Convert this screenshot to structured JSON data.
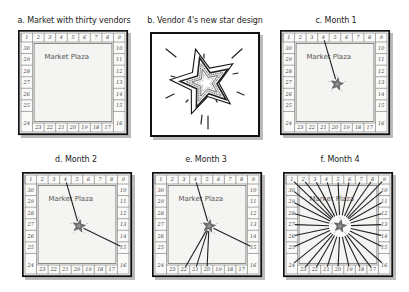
{
  "figure": {
    "panels": [
      {
        "id": "a",
        "title": "a. Market with thirty vendors",
        "type": "market",
        "connections": [],
        "show_star": false
      },
      {
        "id": "b",
        "title": "b. Vendor 4's new star design",
        "type": "star"
      },
      {
        "id": "c",
        "title": "c.  Month 1",
        "type": "market",
        "connections": [
          4
        ],
        "show_star": true
      },
      {
        "id": "d",
        "title": "d. Month 2",
        "type": "market",
        "connections": [
          4,
          15
        ],
        "show_star": true
      },
      {
        "id": "e",
        "title": "e. Month 3",
        "type": "market",
        "connections": [
          4,
          15,
          22,
          21,
          20
        ],
        "show_star": true
      },
      {
        "id": "f",
        "title": "f. Month 4",
        "type": "market",
        "connections": "all",
        "show_star": true
      }
    ],
    "market": {
      "plaza_label": "Market Plaza",
      "vendor_count": 30,
      "top_row": [
        "1",
        "2",
        "3",
        "4",
        "5",
        "6",
        "7",
        "8",
        "9"
      ],
      "right_col": [
        "10",
        "11",
        "12",
        "13",
        "14",
        "15"
      ],
      "bottom_right_corner": "16",
      "bottom_row": [
        "23",
        "22",
        "21",
        "20",
        "19",
        "18",
        "17"
      ],
      "bottom_left_corner": "24",
      "left_col": [
        "30",
        "29",
        "28",
        "27",
        "26",
        "25"
      ]
    },
    "colors": {
      "frame": "#111111",
      "line": "#222222",
      "plaza_fill": "#f4f4f2",
      "stall_fill": "#fafaf8"
    }
  }
}
